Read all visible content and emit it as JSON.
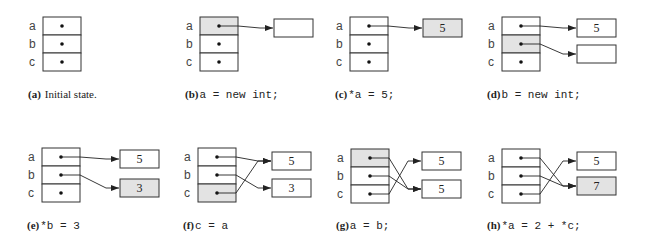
{
  "figure": {
    "variables": [
      "a",
      "b",
      "c"
    ],
    "colors": {
      "highlight": "#e3e3e3",
      "stroke": "#333333",
      "background": "#ffffff"
    },
    "panels": [
      {
        "id": "a",
        "letter": "(a)",
        "caption": "Initial state.",
        "caption_style": "text",
        "highlight_var": null,
        "boxes": [],
        "pointers": []
      },
      {
        "id": "b",
        "letter": "(b)",
        "caption": "a = new int;",
        "caption_style": "code",
        "highlight_var": "a",
        "boxes": [
          {
            "value": "",
            "highlight": false
          }
        ],
        "pointers": [
          {
            "from": "a",
            "to": 0
          }
        ]
      },
      {
        "id": "c",
        "letter": "(c)",
        "caption": "*a = 5;",
        "caption_style": "code",
        "highlight_var": null,
        "boxes": [
          {
            "value": "5",
            "highlight": true
          }
        ],
        "pointers": [
          {
            "from": "a",
            "to": 0
          }
        ]
      },
      {
        "id": "d",
        "letter": "(d)",
        "caption": "b = new int;",
        "caption_style": "code",
        "highlight_var": "b",
        "boxes": [
          {
            "value": "5",
            "highlight": false
          },
          {
            "value": "",
            "highlight": false
          }
        ],
        "pointers": [
          {
            "from": "a",
            "to": 0
          },
          {
            "from": "b",
            "to": 1
          }
        ]
      },
      {
        "id": "e",
        "letter": "(e)",
        "caption": "*b = 3",
        "caption_style": "code",
        "highlight_var": null,
        "boxes": [
          {
            "value": "5",
            "highlight": false
          },
          {
            "value": "3",
            "highlight": true
          }
        ],
        "pointers": [
          {
            "from": "a",
            "to": 0
          },
          {
            "from": "b",
            "to": 1
          }
        ]
      },
      {
        "id": "f",
        "letter": "(f)",
        "caption": "c = a",
        "caption_style": "code",
        "highlight_var": "c",
        "boxes": [
          {
            "value": "5",
            "highlight": false
          },
          {
            "value": "3",
            "highlight": false
          }
        ],
        "pointers": [
          {
            "from": "a",
            "to": 0
          },
          {
            "from": "b",
            "to": 1
          },
          {
            "from": "c",
            "to": 0
          }
        ]
      },
      {
        "id": "g",
        "letter": "(g)",
        "caption": "a = b;",
        "caption_style": "code",
        "highlight_var": "a",
        "boxes": [
          {
            "value": "5",
            "highlight": false
          },
          {
            "value": "5",
            "highlight": false
          }
        ],
        "pointers": [
          {
            "from": "a",
            "to": 1
          },
          {
            "from": "b",
            "to": 1
          },
          {
            "from": "c",
            "to": 0
          }
        ]
      },
      {
        "id": "h",
        "letter": "(h)",
        "caption": "*a = 2 + *c;",
        "caption_style": "code",
        "highlight_var": null,
        "boxes": [
          {
            "value": "5",
            "highlight": false
          },
          {
            "value": "7",
            "highlight": true
          }
        ],
        "pointers": [
          {
            "from": "a",
            "to": 1
          },
          {
            "from": "b",
            "to": 1
          },
          {
            "from": "c",
            "to": 0
          }
        ]
      }
    ]
  }
}
